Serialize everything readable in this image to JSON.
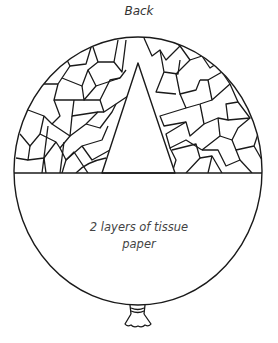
{
  "diagram": {
    "title": "Back",
    "caption": {
      "line1": "2 layers of tissue",
      "line2": "paper"
    },
    "parts": [
      {
        "name": "balloon-outline",
        "shape": "ellipse"
      },
      {
        "name": "tissue-mosaic",
        "region": "upper half of balloon",
        "pattern": "overlapping torn tissue paper pieces"
      },
      {
        "name": "triangle-window",
        "region": "center of upper half",
        "fill": "blank"
      },
      {
        "name": "divider-line",
        "orientation": "horizontal"
      },
      {
        "name": "lower-half",
        "label": "2 layers of tissue paper"
      },
      {
        "name": "balloon-knot",
        "position": "bottom center"
      }
    ],
    "colors": {
      "stroke": "#1a1a1a",
      "background": "#ffffff",
      "text": "#444444"
    }
  }
}
